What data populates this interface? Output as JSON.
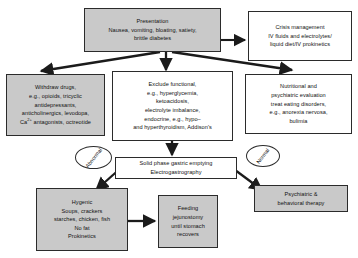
{
  "diagram": {
    "style": {
      "fill_gray": "#c9c9c9",
      "fill_white": "#ffffff",
      "stroke": "#2b2b2b",
      "text": "#111111"
    },
    "nodes": [
      {
        "id": "presentation",
        "fill": "gray",
        "lines": [
          "Presentation",
          "Nausea, vomiting, bloating, satiety,",
          "brittle diabetes"
        ]
      },
      {
        "id": "crisis-management",
        "fill": "white",
        "lines": [
          "Crisis management",
          "IV fluids and electrolytes/",
          "liquid diet/IV prokinetics"
        ]
      },
      {
        "id": "withdraw-drugs",
        "fill": "gray",
        "lines": [
          "Withdraw drugs,",
          "e.g., opioids, tricyclic",
          "antidepressants,",
          "anticholinergics, levodopa,",
          "Ca2+ antagonists, octreotide"
        ]
      },
      {
        "id": "exclude-functional",
        "fill": "white",
        "lines": [
          "Exclude functional,",
          "e.g., hyperglycemia,",
          "ketoacidosis,",
          "electrolyte imbalance,",
          "endocrine, e.g., hypo–",
          "and hyperthyroidism, Addison's"
        ]
      },
      {
        "id": "nutritional-psychiatric",
        "fill": "white",
        "lines": [
          "Nutritional and",
          "psychiatric evaluation",
          "treat eating disorders,",
          "e.g., anorexia nervosa,",
          "bulimia"
        ]
      },
      {
        "id": "gastric-emptying-test",
        "fill": "white",
        "lines": [
          "Solid phase gastric emptying",
          "Electrogastrography"
        ]
      },
      {
        "id": "hygienic",
        "fill": "gray",
        "lines": [
          "Hygenic",
          "Soups, crackers",
          "starches, chicken, fish",
          "No fat",
          "Prokinetics"
        ]
      },
      {
        "id": "feeding-jejunostomy",
        "fill": "gray",
        "lines": [
          "Feeding",
          "jejunostomy",
          "until stomach",
          "recovers"
        ]
      },
      {
        "id": "psychiatric-therapy",
        "fill": "gray",
        "lines": [
          "Psychiatric &",
          "behavioral therapy"
        ]
      }
    ],
    "branch_labels": [
      {
        "id": "abnormal",
        "text": "Abnormal"
      },
      {
        "id": "normal",
        "text": "Normal"
      }
    ]
  }
}
